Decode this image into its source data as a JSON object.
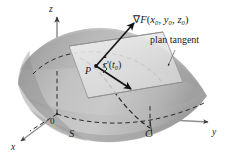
{
  "figure": {
    "type": "math-diagram-3d-surface-tangent-plane",
    "background_color": "#ffffff",
    "ink_color": "#1a1a1a"
  },
  "labels": {
    "gradient_nabla": "∇",
    "gradient_function": "F",
    "gradient_args_open": "(",
    "gradient_x": "x",
    "gradient_x_sub": "0",
    "gradient_comma1": ", ",
    "gradient_y": "y",
    "gradient_y_sub": "0",
    "gradient_comma2": ", ",
    "gradient_z": "z",
    "gradient_z_sub": "0",
    "gradient_args_close": ")",
    "tangent_plane": "plan tangent",
    "point_P": "P",
    "tangent_vector_r": "r",
    "tangent_vector_prime": "'(",
    "tangent_vector_t": "t",
    "tangent_vector_t_sub": "0",
    "tangent_vector_close": ")",
    "axis_z": "z",
    "axis_y": "y",
    "axis_x": "x",
    "origin": "0",
    "surface_S": "S",
    "curve_C": "C"
  },
  "colors": {
    "surface_light": "#d2d2d2",
    "surface_mid": "#b4b4b4",
    "surface_dark": "#9a9a9a",
    "surface_shadow": "#8a8a8a",
    "plane_fill": "#e8e8e8",
    "plane_edge": "#9c9c9c",
    "axis": "#7a7a7a",
    "dashed": "#2a2a2a",
    "arrow": "#151515"
  },
  "geometry": {
    "origin_point": [
      57,
      114
    ],
    "point_P": [
      96,
      66
    ],
    "gradient_tip": [
      133,
      22
    ],
    "tangent_vector_tip": [
      130,
      88
    ],
    "axis_z_tip": [
      57,
      14
    ],
    "axis_y_tip": [
      211,
      122
    ],
    "axis_x_tip": [
      18,
      144
    ]
  }
}
